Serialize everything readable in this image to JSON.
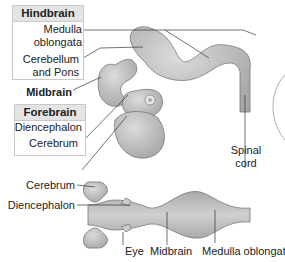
{
  "top_diagram": {
    "hindbrain_box": {
      "title": "Hindbrain",
      "items": [
        "Medulla oblongata",
        "Cerebellum and Pons"
      ],
      "medulla_line1": "Medulla",
      "medulla_line2": "oblongata",
      "cerebellum_line1": "Cerebellum",
      "cerebellum_line2": "and Pons"
    },
    "midbrain_label": "Midbrain",
    "forebrain_box": {
      "title": "Forebrain",
      "items": [
        "Diencephalon",
        "Cerebrum"
      ]
    },
    "spinal_cord_line1": "Spinal",
    "spinal_cord_line2": "cord"
  },
  "bottom_diagram": {
    "labels": {
      "cerebrum": "Cerebrum",
      "diencephalon": "Diencephalon",
      "eye": "Eye",
      "midbrain": "Midbrain",
      "medulla": "Medulla oblongata"
    }
  },
  "colors": {
    "tissue": "#b9b9b9",
    "tissue_light": "#d6d6d6",
    "box_header": "#e4e4e4",
    "box_border": "#c8c8c8"
  }
}
